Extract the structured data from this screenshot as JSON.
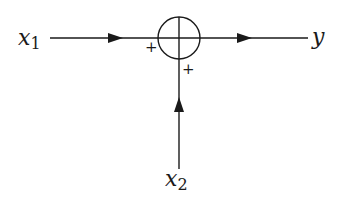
{
  "diagram": {
    "type": "summing-junction",
    "inputs": [
      {
        "label": "x",
        "subscript": "1",
        "sign": "+",
        "direction": "from-left"
      },
      {
        "label": "x",
        "subscript": "2",
        "sign": "+",
        "direction": "from-below"
      }
    ],
    "output": {
      "label": "y",
      "direction": "to-right"
    },
    "junction": {
      "symbol": "circle-with-cross"
    },
    "colors": {
      "stroke": "#1a1a1a",
      "background": "#ffffff"
    }
  }
}
